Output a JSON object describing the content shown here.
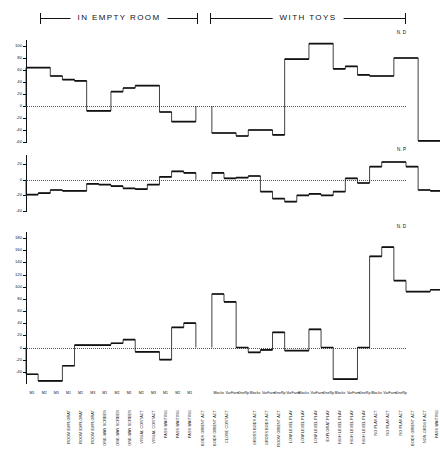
{
  "header": {
    "left_bracket_label": "IN EMPTY ROOM",
    "right_bracket_label": "WITH TOYS"
  },
  "panels": [
    {
      "id": "panel-a",
      "corner_label": "N. D"
    },
    {
      "id": "panel-b",
      "corner_label": "N. P"
    },
    {
      "id": "panel-c",
      "corner_label": "N. D"
    }
  ],
  "chart_data": [
    {
      "type": "bar",
      "title": "",
      "panel_label": "N. D",
      "xlabel": "",
      "ylabel": "",
      "ylim": [
        -60,
        110
      ],
      "yticks": [
        -60,
        -40,
        -20,
        0,
        20,
        40,
        60,
        80,
        100
      ],
      "ytick_labels": [
        "-60",
        "-40",
        "-20",
        "0",
        "20",
        "40",
        "60",
        "80",
        "100"
      ],
      "grid": false,
      "zero_line": true,
      "group_break_after_index": 13,
      "categories": [
        "ROOM EXPLORAT M1",
        "ROOM EXPLORAT M2",
        "ROOM EXPLORAT M3",
        "ONE-WAY SCREEN M1",
        "ONE-WAY SCREEN M2",
        "ONE-WAY SCREEN M3",
        "VISUAL CONTACT M1",
        "VISUAL CONTACT M2",
        "PASS WAITING M1",
        "PASS WAITING M2",
        "PASS WAITING M3",
        "BODY ORIENT ACT M1",
        "BODY ORIENT ACT M2",
        "CLOSE CONTACT M1",
        "GROSS BODY ACT Blocks",
        "GROSS BODY ACT VarFarm",
        "GROSS BODY ACT OneRp",
        "ROOM ORIENT ACT Blocks",
        "ROOM ORIENT ACT VarFarm",
        "ROOM ORIENT ACT OneRp",
        "LOW LEVEL PLAY Blocks",
        "LOW LEVEL PLAY VarFarm",
        "LOW LEVEL PLAY OneRp",
        "EXPLORAT PLAY Blocks",
        "EXPLORAT PLAY VarFarm",
        "HIGH LEVEL PLAY Blocks",
        "HIGH LEVEL PLAY VarFarm",
        "HIGH LEVEL PLAY OneRp",
        "NO PLAY ACT Blocks",
        "NO PLAY ACT VarFarm",
        "NO PLAY ACT OneRp",
        "BODY ORIENT ACT Blocks",
        "NON-GROUP ACT VarFarm",
        "PASS WAITING OneRp"
      ],
      "values": [
        64,
        64,
        50,
        44,
        42,
        -8,
        -8,
        24,
        30,
        34,
        34,
        -10,
        -26,
        -26,
        -45,
        -45,
        -50,
        -40,
        -40,
        -48,
        78,
        78,
        104,
        104,
        62,
        66,
        52,
        50,
        50,
        80,
        80,
        -58,
        -58,
        -52
      ],
      "values_full": [
        64,
        64,
        50,
        44,
        42,
        -8,
        -8,
        24,
        30,
        34,
        34,
        -10,
        -26,
        -45,
        -45,
        -50,
        -40,
        -48,
        78,
        78,
        104,
        62,
        66,
        52,
        50,
        80,
        -58,
        -52,
        -36,
        -24,
        -4,
        -12,
        56,
        -22,
        4,
        4,
        54
      ]
    },
    {
      "type": "bar",
      "title": "",
      "panel_label": "N. P",
      "xlabel": "",
      "ylabel": "",
      "ylim": [
        -40,
        32
      ],
      "yticks": [
        -40,
        -20,
        0,
        20
      ],
      "ytick_labels": [
        "-40",
        "-20",
        "0",
        "20"
      ],
      "grid": false,
      "zero_line": true,
      "group_break_after_index": 13,
      "categories": [
        "ROOM EXPLORAT M1",
        "ROOM EXPLORAT M2",
        "ROOM EXPLORAT M3",
        "ONE-WAY SCREEN M1",
        "ONE-WAY SCREEN M2",
        "ONE-WAY SCREEN M3",
        "VISUAL CONTACT M1",
        "VISUAL CONTACT M2",
        "PASS WAITING M1",
        "PASS WAITING M2",
        "PASS WAITING M3",
        "BODY ORIENT ACT M1",
        "BODY ORIENT ACT M2",
        "CLOSE CONTACT M1",
        "GROSS BODY ACT Blocks",
        "GROSS BODY ACT VarFarm",
        "GROSS BODY ACT OneRp",
        "ROOM ORIENT ACT Blocks",
        "ROOM ORIENT ACT VarFarm",
        "ROOM ORIENT ACT OneRp",
        "LOW LEVEL PLAY Blocks",
        "LOW LEVEL PLAY VarFarm",
        "LOW LEVEL PLAY OneRp",
        "EXPLORAT PLAY Blocks",
        "EXPLORAT PLAY VarFarm",
        "HIGH LEVEL PLAY Blocks",
        "HIGH LEVEL PLAY VarFarm",
        "HIGH LEVEL PLAY OneRp",
        "NO PLAY ACT Blocks",
        "NO PLAY ACT VarFarm",
        "NO PLAY ACT OneRp",
        "BODY ORIENT ACT Blocks",
        "NON-GROUP ACT VarFarm",
        "PASS WAITING OneRp"
      ],
      "values": [
        -19,
        -17,
        -13,
        -14,
        -14,
        -5,
        -6,
        -8,
        -11,
        -12,
        -6,
        4,
        11,
        9,
        9,
        2,
        3,
        5,
        -15,
        -24,
        -28,
        -20,
        -18,
        -20,
        -15,
        2,
        -4,
        17,
        23,
        23,
        17,
        -13,
        -14,
        -26
      ]
    },
    {
      "type": "bar",
      "title": "",
      "panel_label": "N. D",
      "xlabel": "",
      "ylabel": "",
      "ylim": [
        -60,
        190
      ],
      "yticks": [
        -40,
        -20,
        0,
        20,
        40,
        60,
        80,
        100,
        120,
        140,
        160,
        180
      ],
      "ytick_labels": [
        "-40",
        "-20",
        "0",
        "20",
        "40",
        "60",
        "80",
        "100",
        "120",
        "140",
        "160",
        "180"
      ],
      "grid": false,
      "zero_line": true,
      "group_break_after_index": 13,
      "categories": [
        "ROOM EXPLORAT M1",
        "ROOM EXPLORAT M2",
        "ROOM EXPLORAT M3",
        "ONE-WAY SCREEN M1",
        "ONE-WAY SCREEN M2",
        "ONE-WAY SCREEN M3",
        "VISUAL CONTACT M1",
        "VISUAL CONTACT M2",
        "PASS WAITING M1",
        "PASS WAITING M2",
        "PASS WAITING M3",
        "BODY ORIENT ACT M1",
        "BODY ORIENT ACT M2",
        "CLOSE CONTACT M1",
        "GROSS BODY ACT Blocks",
        "GROSS BODY ACT VarFarm",
        "GROSS BODY ACT OneRp",
        "ROOM ORIENT ACT Blocks",
        "ROOM ORIENT ACT VarFarm",
        "ROOM ORIENT ACT OneRp",
        "LOW LEVEL PLAY Blocks",
        "LOW LEVEL PLAY VarFarm",
        "LOW LEVEL PLAY OneRp",
        "EXPLORAT PLAY Blocks",
        "EXPLORAT PLAY VarFarm",
        "HIGH LEVEL PLAY Blocks",
        "HIGH LEVEL PLAY VarFarm",
        "HIGH LEVEL PLAY OneRp",
        "NO PLAY ACT Blocks",
        "NO PLAY ACT VarFarm",
        "NO PLAY ACT OneRp",
        "BODY ORIENT ACT Blocks",
        "NON-GROUP ACT VarFarm",
        "PASS WAITING OneRp"
      ],
      "values": [
        -44,
        -55,
        -55,
        -30,
        4,
        4,
        4,
        7,
        13,
        -7,
        -7,
        -20,
        33,
        40,
        88,
        75,
        0,
        -8,
        -4,
        25,
        -5,
        -5,
        30,
        0,
        -52,
        -52,
        0,
        150,
        165,
        110,
        92,
        92,
        95,
        0
      ]
    }
  ],
  "x_axis": {
    "left_group": [
      {
        "name": "ROOM EXPLORAT",
        "sub": "M1"
      },
      {
        "name": "ROOM EXPLORAT",
        "sub": "M2"
      },
      {
        "name": "ROOM EXPLORAT",
        "sub": "M3"
      },
      {
        "name": "ONE-WAY SCREEN",
        "sub": "M1"
      },
      {
        "name": "ONE-WAY SCREEN",
        "sub": "M2"
      },
      {
        "name": "ONE-WAY SCREEN",
        "sub": "M3"
      },
      {
        "name": "VISUAL CONTACT",
        "sub": "M1"
      },
      {
        "name": "VISUAL CONTACT",
        "sub": "M2"
      },
      {
        "name": "PASS WAITING",
        "sub": "M1"
      },
      {
        "name": "PASS WAITING",
        "sub": "M2"
      },
      {
        "name": "PASS WAITING",
        "sub": "M3"
      },
      {
        "name": "BODY ORIENT ACT",
        "sub": "M1"
      },
      {
        "name": "BODY ORIENT ACT",
        "sub": "M2"
      },
      {
        "name": "CLOSE CONTACT",
        "sub": "M1"
      }
    ],
    "right_group": [
      {
        "name": "GROSS BODY ACT",
        "sub": "Blocks"
      },
      {
        "name": "GROSS BODY ACT",
        "sub": "VarFarm"
      },
      {
        "name": "ROOM ORIENT ACT",
        "sub": "OneRp"
      },
      {
        "name": "LOW LEVEL PLAY",
        "sub": "Blocks"
      },
      {
        "name": "LOW LEVEL PLAY",
        "sub": "VarFarm"
      },
      {
        "name": "LOW LEVEL PLAY",
        "sub": "OneRp"
      },
      {
        "name": "EXPLORAT PLAY",
        "sub": "VarFarm"
      },
      {
        "name": "HIGH LEVEL PLAY",
        "sub": "Blocks"
      },
      {
        "name": "HIGH LEVEL PLAY",
        "sub": "VarFarm"
      },
      {
        "name": "HIGH LEVEL PLAY",
        "sub": "OneRp"
      },
      {
        "name": "NO PLAY ACT",
        "sub": "Blocks"
      },
      {
        "name": "NO PLAY ACT",
        "sub": "VarFarm"
      },
      {
        "name": "NO PLAY ACT",
        "sub": "OneRp"
      },
      {
        "name": "BODY ORIENT ACT",
        "sub": "Blocks"
      },
      {
        "name": "NON-GROUP ACT",
        "sub": "VarFarm"
      },
      {
        "name": "PASS WAITING",
        "sub": "OneRp"
      }
    ]
  },
  "colors": {
    "ink": "#111111",
    "zero_line": "#555555",
    "background": "#ffffff"
  }
}
